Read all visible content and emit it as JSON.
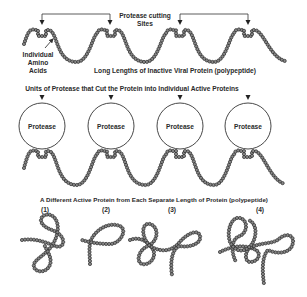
{
  "diagram": {
    "labels": {
      "cutting_sites_line1": "Protease cutting",
      "cutting_sites_line2": "Sites",
      "amino_line1": "Individual",
      "amino_line2": "Amino",
      "amino_line3": "Acids",
      "polypeptide": "Long Lengths of Inactive Viral Protein (polypeptide)",
      "units_heading": "Units of Protease that Cut the Protein into Individual Active Proteins",
      "active_heading": "A Different Active Protein from Each Separate Length of Protein (polypeptide)"
    },
    "protease_units": [
      {
        "label": "Protease"
      },
      {
        "label": "Protease"
      },
      {
        "label": "Protease"
      },
      {
        "label": "Protease"
      }
    ],
    "active_proteins": [
      {
        "number": "(1)"
      },
      {
        "number": "(2)"
      },
      {
        "number": "(3)"
      },
      {
        "number": "(4)"
      }
    ],
    "colors": {
      "bead_fill": "#888888",
      "bead_stroke": "#2a2a2a",
      "line": "#333333",
      "background": "#ffffff"
    }
  }
}
